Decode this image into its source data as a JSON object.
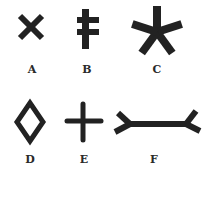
{
  "figure": {
    "symbols": [
      {
        "id": "A",
        "label": "A",
        "shape": "x-cross-icon"
      },
      {
        "id": "B",
        "label": "B",
        "shape": "cross-of-lorraine-icon"
      },
      {
        "id": "C",
        "label": "C",
        "shape": "five-point-asterisk-icon"
      },
      {
        "id": "D",
        "label": "D",
        "shape": "diamond-outline-icon"
      },
      {
        "id": "E",
        "label": "E",
        "shape": "plus-cross-icon"
      },
      {
        "id": "F",
        "label": "F",
        "shape": "forked-bar-icon"
      }
    ],
    "ink_color": "#222222"
  }
}
